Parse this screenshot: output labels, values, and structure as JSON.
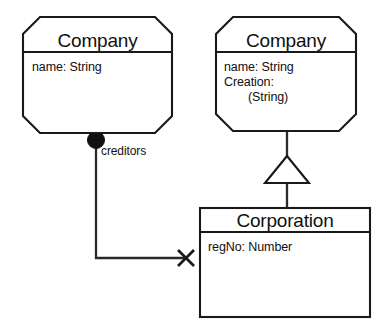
{
  "diagram": {
    "background_color": "#ffffff",
    "line_color": "#191919",
    "fill_color": "#ffffff",
    "marker_fill_color": "#111111"
  },
  "classes": [
    {
      "id": "company-left",
      "name": "Company",
      "shape": "octagon",
      "attributes": [
        {
          "text": "name: String",
          "indent": 0
        }
      ]
    },
    {
      "id": "company-right",
      "name": "Company",
      "shape": "octagon",
      "attributes": [
        {
          "text": "name: String",
          "indent": 0
        },
        {
          "text": "Creation:",
          "indent": 0
        },
        {
          "text": "(String)",
          "indent": 1
        }
      ]
    },
    {
      "id": "corporation",
      "name": "Corporation",
      "shape": "rectangle",
      "attributes": [
        {
          "text": "regNo: Number",
          "indent": 0
        }
      ]
    }
  ],
  "relationships": [
    {
      "id": "creditors-association",
      "kind": "composition",
      "source": "company-left",
      "target": "corporation",
      "role_label": "creditors",
      "source_marker": "filled-ball",
      "target_marker": "x-cross"
    },
    {
      "id": "generalization",
      "kind": "generalization",
      "source": "corporation",
      "target": "company-right",
      "target_marker": "hollow-triangle"
    }
  ],
  "labels": {
    "creditors": "creditors"
  }
}
